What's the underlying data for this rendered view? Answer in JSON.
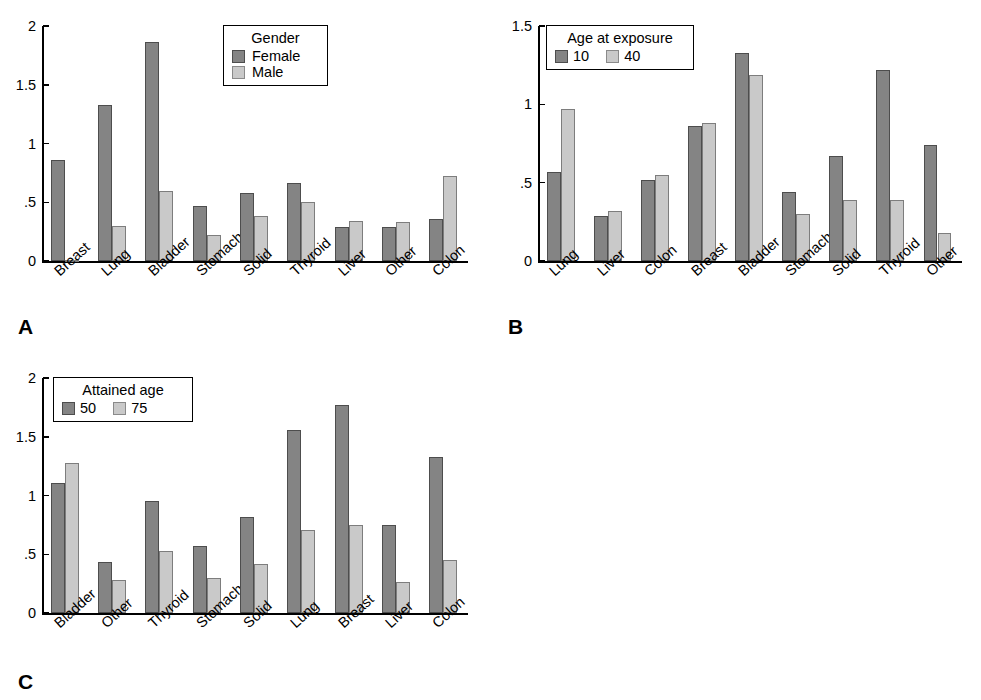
{
  "figure": {
    "panels": [
      {
        "letter": "A",
        "legend": {
          "title": "Gender",
          "orientation": "vertical",
          "entries": [
            {
              "label": "Female",
              "color": "#848484"
            },
            {
              "label": "Male",
              "color": "#c9c9c9"
            }
          ]
        },
        "chart_data": {
          "type": "bar",
          "title": "",
          "xlabel": "",
          "ylabel": "",
          "ylim": [
            0,
            2
          ],
          "yticks": [
            0,
            0.5,
            1,
            1.5,
            2
          ],
          "ytick_labels": [
            "0",
            ".5",
            "1",
            "1.5",
            "2"
          ],
          "grid": false,
          "legend_position": "top-right",
          "categories": [
            "Breast",
            "Lung",
            "Bladder",
            "Stomach",
            "Solid",
            "Thyroid",
            "Liver",
            "Other",
            "Colon"
          ],
          "series": [
            {
              "name": "Female",
              "color": "#848484",
              "values": [
                0.86,
                1.33,
                1.86,
                0.47,
                0.58,
                0.66,
                0.29,
                0.29,
                0.36
              ]
            },
            {
              "name": "Male",
              "color": "#c9c9c9",
              "values": [
                0.01,
                0.3,
                0.6,
                0.22,
                0.38,
                0.5,
                0.34,
                0.33,
                0.72
              ]
            }
          ]
        }
      },
      {
        "letter": "B",
        "legend": {
          "title": "Age at exposure",
          "orientation": "horizontal",
          "entries": [
            {
              "label": "10",
              "color": "#848484"
            },
            {
              "label": "40",
              "color": "#c9c9c9"
            }
          ]
        },
        "chart_data": {
          "type": "bar",
          "title": "",
          "xlabel": "",
          "ylabel": "",
          "ylim": [
            0,
            1.5
          ],
          "yticks": [
            0,
            0.5,
            1,
            1.5
          ],
          "ytick_labels": [
            "0",
            ".5",
            "1",
            "1.5"
          ],
          "grid": false,
          "legend_position": "top-left",
          "categories": [
            "Lung",
            "Liver",
            "Colon",
            "Breast",
            "Bladder",
            "Stomach",
            "Solid",
            "Thyroid",
            "Other"
          ],
          "series": [
            {
              "name": "10",
              "color": "#848484",
              "values": [
                0.57,
                0.29,
                0.52,
                0.86,
                1.33,
                0.44,
                0.67,
                1.22,
                0.74
              ]
            },
            {
              "name": "40",
              "color": "#c9c9c9",
              "values": [
                0.97,
                0.32,
                0.55,
                0.88,
                1.19,
                0.3,
                0.39,
                0.39,
                0.18
              ]
            }
          ]
        }
      },
      {
        "letter": "C",
        "legend": {
          "title": "Attained age",
          "orientation": "horizontal",
          "entries": [
            {
              "label": "50",
              "color": "#848484"
            },
            {
              "label": "75",
              "color": "#c9c9c9"
            }
          ]
        },
        "chart_data": {
          "type": "bar",
          "title": "",
          "xlabel": "",
          "ylabel": "",
          "ylim": [
            0,
            2
          ],
          "yticks": [
            0,
            0.5,
            1,
            1.5,
            2
          ],
          "ytick_labels": [
            "0",
            ".5",
            "1",
            "1.5",
            "2"
          ],
          "grid": false,
          "legend_position": "top-left",
          "categories": [
            "Bladder",
            "Other",
            "Thyroid",
            "Stomach",
            "Solid",
            "Lung",
            "Breast",
            "Liver",
            "Colon"
          ],
          "series": [
            {
              "name": "50",
              "color": "#848484",
              "values": [
                1.11,
                0.43,
                0.95,
                0.57,
                0.82,
                1.56,
                1.77,
                0.75,
                1.33
              ]
            },
            {
              "name": "75",
              "color": "#c9c9c9",
              "values": [
                1.28,
                0.28,
                0.53,
                0.3,
                0.42,
                0.71,
                0.75,
                0.26,
                0.45
              ]
            }
          ]
        }
      }
    ]
  }
}
